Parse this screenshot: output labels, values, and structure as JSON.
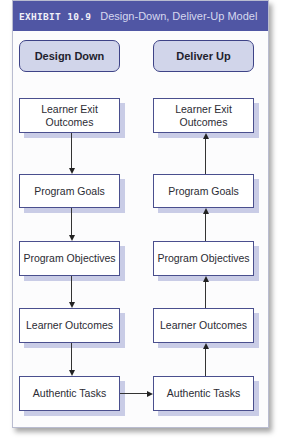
{
  "exhibit": {
    "label": "EXHIBIT 10.9",
    "title": "Design-Down, Deliver-Up Model"
  },
  "columns": [
    {
      "heading": "Design Down",
      "flow_direction": "down",
      "boxes": [
        "Learner Exit Outcomes",
        "Program Goals",
        "Program Objectives",
        "Learner Outcomes",
        "Authentic Tasks"
      ]
    },
    {
      "heading": "Deliver Up",
      "flow_direction": "up",
      "boxes": [
        "Learner Exit Outcomes",
        "Program Goals",
        "Program Objectives",
        "Learner Outcomes",
        "Authentic Tasks"
      ]
    }
  ],
  "connector": {
    "from": "Design Down / Authentic Tasks",
    "to": "Deliver Up / Authentic Tasks",
    "direction": "right"
  },
  "colors": {
    "header_bg": "#5056a4",
    "pill_bg": "#d1d5ea",
    "pill_border": "#3e4387",
    "box_border": "#4a4f8e",
    "box_shadow": "#c9cce6"
  }
}
